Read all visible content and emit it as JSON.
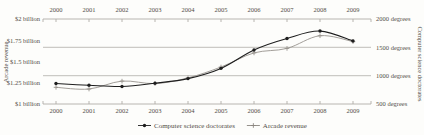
{
  "colors": {
    "background": "#fdfdfb",
    "text": "#524e48",
    "axis": "#b0ada7",
    "series_doctorates": "#1e1e1e",
    "series_arcade": "#97938d"
  },
  "chart_data": {
    "type": "line",
    "x_labels": [
      "2000",
      "2001",
      "2002",
      "2003",
      "2004",
      "2005",
      "2006",
      "2007",
      "2008",
      "2009"
    ],
    "series": [
      {
        "name": "Computer science doctorates",
        "axis": "right",
        "marker": "circle",
        "color": "#1e1e1e",
        "values": [
          861,
          830,
          809,
          867,
          948,
          1129,
          1453,
          1656,
          1787,
          1611
        ]
      },
      {
        "name": "Arcade revenue",
        "axis": "left",
        "marker": "plus",
        "color": "#97938d",
        "values": [
          1.196,
          1.176,
          1.269,
          1.24,
          1.307,
          1.435,
          1.601,
          1.654,
          1.803,
          1.734
        ]
      }
    ],
    "left_axis": {
      "title": "Arcade revenue",
      "range": [
        1,
        2
      ],
      "ticks": [
        {
          "value": 2,
          "label": "$2 billion"
        },
        {
          "value": 1.75,
          "label": "$1.75 billion"
        },
        {
          "value": 1.5,
          "label": "$1.5 billion"
        },
        {
          "value": 1.25,
          "label": "$1.25 billion"
        },
        {
          "value": 1,
          "label": "$1 billion"
        }
      ]
    },
    "right_axis": {
      "title": "Computer science doctorates",
      "range": [
        500,
        2000
      ],
      "ticks": [
        {
          "value": 2000,
          "label": "2000 degrees"
        },
        {
          "value": 1500,
          "label": "1500 degrees"
        },
        {
          "value": 1000,
          "label": "1000 degrees"
        },
        {
          "value": 500,
          "label": "500 degrees"
        }
      ],
      "gridlines": [
        1500,
        1000
      ]
    },
    "legend": {
      "position": "bottom-center",
      "entries": [
        {
          "label": "Computer science doctorates",
          "marker": "circle",
          "color": "#1e1e1e"
        },
        {
          "label": "Arcade revenue",
          "marker": "plus",
          "color": "#8a867f"
        }
      ]
    },
    "grid": "horizontal-only",
    "title": "",
    "xlabel": "",
    "x_axis_position": "top-and-bottom"
  }
}
